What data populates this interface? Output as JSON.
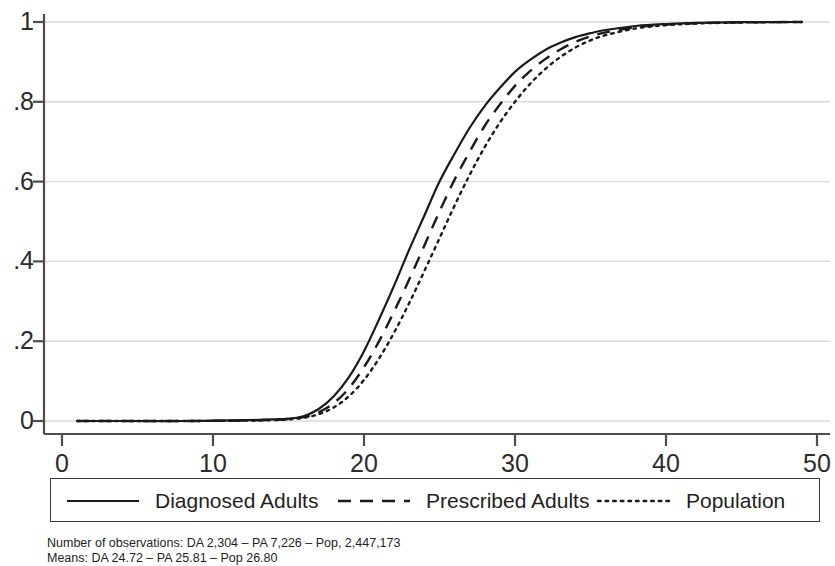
{
  "chart_data": {
    "type": "line",
    "title": "",
    "subtitle": "",
    "xlabel": "",
    "ylabel": "",
    "xlim": [
      0,
      50
    ],
    "ylim": [
      0,
      1
    ],
    "grid": "horizontal",
    "legend_position": "bottom",
    "xticks": [
      "0",
      "10",
      "20",
      "30",
      "40",
      "50"
    ],
    "xtick_values": [
      0,
      10,
      20,
      30,
      40,
      50
    ],
    "yticks": [
      "0",
      ".2",
      ".4",
      ".6",
      ".8",
      "1"
    ],
    "ytick_values": [
      0,
      0.2,
      0.4,
      0.6,
      0.8,
      1
    ],
    "x": [
      1,
      4,
      8,
      12,
      14,
      15,
      16,
      17,
      18,
      19,
      20,
      21,
      22,
      23,
      24,
      25,
      26,
      27,
      28,
      29,
      30,
      31,
      32,
      33,
      34,
      35,
      36,
      38,
      40,
      42,
      45,
      49
    ],
    "series": [
      {
        "name": "Diagnosed Adults",
        "style": "solid",
        "color": "#1a1a1a",
        "values": [
          0.0,
          0.0,
          0.0,
          0.002,
          0.004,
          0.006,
          0.012,
          0.03,
          0.062,
          0.11,
          0.175,
          0.255,
          0.34,
          0.43,
          0.515,
          0.6,
          0.67,
          0.735,
          0.79,
          0.835,
          0.875,
          0.905,
          0.93,
          0.948,
          0.962,
          0.972,
          0.98,
          0.99,
          0.995,
          0.998,
          0.9995,
          1.0
        ]
      },
      {
        "name": "Prescribed Adults",
        "style": "dashed",
        "color": "#1a1a1a",
        "values": [
          0.0,
          0.0,
          0.0,
          0.001,
          0.003,
          0.005,
          0.01,
          0.022,
          0.045,
          0.082,
          0.135,
          0.2,
          0.275,
          0.355,
          0.44,
          0.525,
          0.605,
          0.675,
          0.74,
          0.793,
          0.84,
          0.877,
          0.907,
          0.931,
          0.95,
          0.964,
          0.974,
          0.987,
          0.9935,
          0.997,
          0.9992,
          1.0
        ]
      },
      {
        "name": "Population",
        "style": "dotted",
        "color": "#1a1a1a",
        "values": [
          0.0,
          0.0,
          0.0,
          0.001,
          0.002,
          0.004,
          0.008,
          0.017,
          0.034,
          0.062,
          0.103,
          0.157,
          0.222,
          0.296,
          0.376,
          0.458,
          0.54,
          0.617,
          0.687,
          0.748,
          0.8,
          0.845,
          0.882,
          0.912,
          0.936,
          0.954,
          0.967,
          0.984,
          0.992,
          0.996,
          0.9989,
          1.0
        ]
      }
    ],
    "annotations": [
      "Number of observations: DA 2,304 – PA 7,226 – Pop, 2,447,173",
      "Means: DA 24.72 – PA 25.81 – Pop 26.80"
    ]
  },
  "legend": {
    "entries": [
      {
        "label": "Diagnosed Adults",
        "style": "solid"
      },
      {
        "label": "Prescribed Adults",
        "style": "dashed"
      },
      {
        "label": "Population",
        "style": "dotted"
      }
    ]
  },
  "caption": {
    "line1": "Number of observations: DA 2,304 – PA 7,226 – Pop, 2,447,173",
    "line2": "Means: DA 24.72 – PA 25.81 – Pop 26.80"
  },
  "colors": {
    "line": "#1a1a1a",
    "grid": "#d8d8d8",
    "axis": "#4d4d4d",
    "text": "#231f20"
  }
}
